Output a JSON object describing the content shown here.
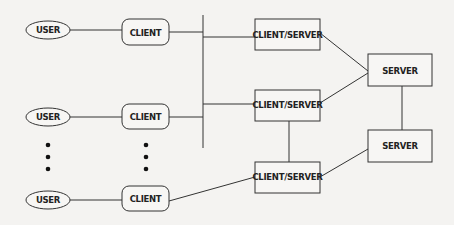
{
  "diagram": {
    "type": "network-architecture",
    "users": [
      {
        "label": "USER"
      },
      {
        "label": "USER"
      },
      {
        "label": "USER"
      }
    ],
    "clients": [
      {
        "label": "CLIENT"
      },
      {
        "label": "CLIENT"
      },
      {
        "label": "CLIENT"
      }
    ],
    "client_servers": [
      {
        "label": "CLIENT/SERVER"
      },
      {
        "label": "CLIENT/SERVER"
      },
      {
        "label": "CLIENT/SERVER"
      }
    ],
    "servers": [
      {
        "label": "SERVER"
      },
      {
        "label": "SERVER"
      }
    ],
    "ellipsis_indicator": "vertical dots between rows 2 and 3",
    "edges": [
      [
        "USER 1",
        "CLIENT 1"
      ],
      [
        "USER 2",
        "CLIENT 2"
      ],
      [
        "USER 3",
        "CLIENT 3"
      ],
      [
        "CLIENT 1",
        "BUS"
      ],
      [
        "CLIENT 2",
        "BUS"
      ],
      [
        "BUS",
        "CLIENT/SERVER 1"
      ],
      [
        "BUS",
        "CLIENT/SERVER 2"
      ],
      [
        "CLIENT 3",
        "CLIENT/SERVER 3"
      ],
      [
        "CLIENT/SERVER 1",
        "SERVER 1"
      ],
      [
        "CLIENT/SERVER 2",
        "SERVER 1"
      ],
      [
        "CLIENT/SERVER 2",
        "CLIENT/SERVER 3"
      ],
      [
        "CLIENT/SERVER 3",
        "SERVER 2"
      ],
      [
        "SERVER 1",
        "SERVER 2"
      ]
    ]
  }
}
